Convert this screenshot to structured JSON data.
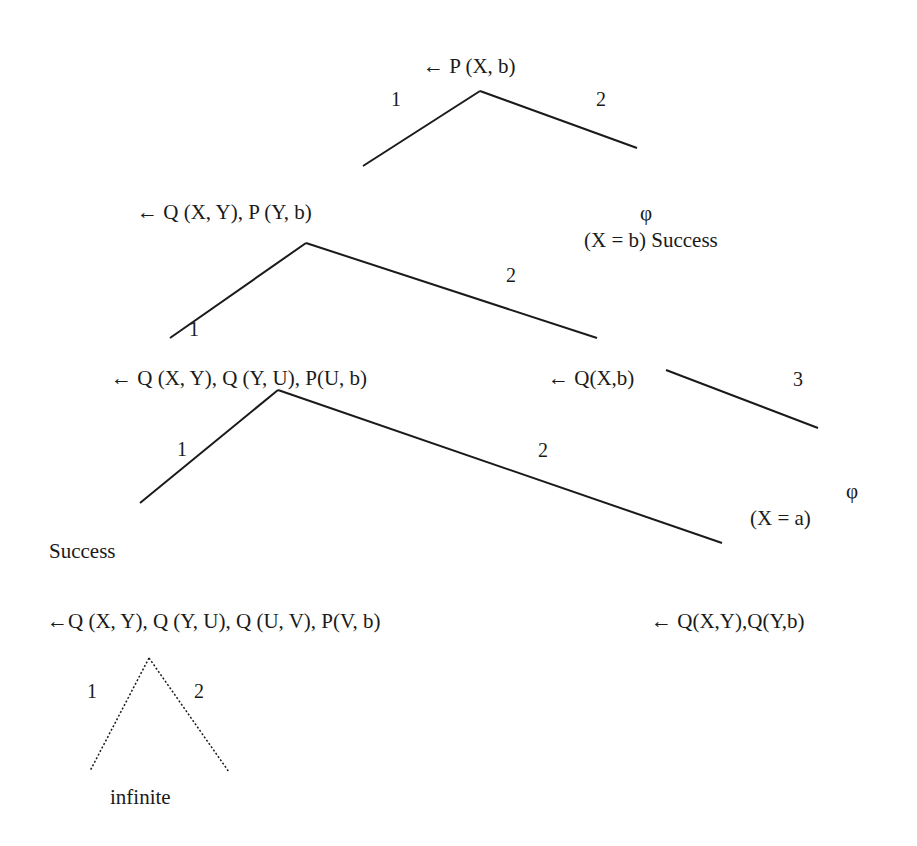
{
  "diagram": {
    "type": "sld-resolution-tree",
    "nodes": {
      "root": "← P (X, b)",
      "level1_left": "←  Q (X, Y), P (Y, b)",
      "level1_right_empty": "φ",
      "level1_right_binding": "(X = b)  Success",
      "level2_left": "← Q (X, Y), Q (Y, U), P(U, b)",
      "level2_right": "← Q(X,b)",
      "level3_success": "Success",
      "level3_left": "←Q (X, Y), Q (Y, U), Q (U, V),  P(V, b)",
      "level3_right_empty": "φ",
      "level3_right_binding": "(X = a)",
      "level3_far_right": "← Q(X,Y),Q(Y,b)",
      "infinite_label": "infinite"
    },
    "edge_labels": {
      "root_1": "1",
      "root_2": "2",
      "l1_1": "1",
      "l1_2": "2",
      "qxb_3": "3",
      "l2_1": "1",
      "l2_2": "2",
      "l3_1": "1",
      "l3_2": "2"
    },
    "colors": {
      "line": "#1a1a1a",
      "background": "#ffffff"
    }
  }
}
